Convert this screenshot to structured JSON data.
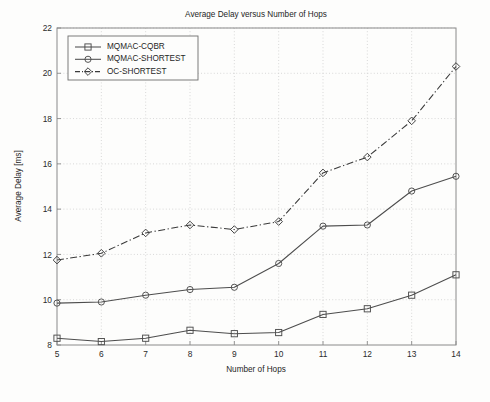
{
  "chart_data": {
    "type": "line",
    "title": "Average Delay versus Number of Hops",
    "xlabel": "Number of Hops",
    "ylabel": "Average Delay [ms]",
    "x": [
      5,
      6,
      7,
      8,
      9,
      10,
      11,
      12,
      13,
      14
    ],
    "xlim": [
      5,
      14
    ],
    "ylim": [
      8,
      22
    ],
    "xticks": [
      "5",
      "6",
      "7",
      "8",
      "9",
      "10",
      "11",
      "12",
      "13",
      "14"
    ],
    "yticks": [
      "8",
      "10",
      "12",
      "14",
      "16",
      "18",
      "20",
      "22"
    ],
    "grid": true,
    "legend_position": "top-left",
    "series": [
      {
        "name": "MQMAC-CQBR",
        "marker": "square",
        "linestyle": "solid",
        "color": "#4d4d4d",
        "values": [
          8.3,
          8.15,
          8.3,
          8.65,
          8.5,
          8.55,
          9.35,
          9.6,
          10.2,
          11.1
        ]
      },
      {
        "name": "MQMAC-SHORTEST",
        "marker": "circle",
        "linestyle": "solid",
        "color": "#4d4d4d",
        "values": [
          9.85,
          9.9,
          10.2,
          10.45,
          10.55,
          11.6,
          13.25,
          13.3,
          14.8,
          15.45
        ]
      },
      {
        "name": "OC-SHORTEST",
        "marker": "diamond",
        "linestyle": "dashdot",
        "color": "#3a3a3a",
        "values": [
          11.75,
          12.05,
          12.95,
          13.3,
          13.1,
          13.45,
          15.6,
          16.3,
          17.9,
          20.3
        ]
      }
    ]
  },
  "figure": {
    "background_color": "#fdfdfc",
    "axes_color": "#808080",
    "grid_color": "#c9c9c9",
    "legend_border_color": "#6e6e6e"
  }
}
